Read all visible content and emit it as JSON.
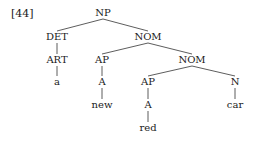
{
  "example_number": "[44]",
  "tree": {
    "nodes": [
      {
        "id": "np",
        "label": "NP",
        "x": 103,
        "y": 13
      },
      {
        "id": "det",
        "label": "DET",
        "x": 57,
        "y": 37
      },
      {
        "id": "nom1",
        "label": "NOM",
        "x": 148,
        "y": 37
      },
      {
        "id": "art",
        "label": "ART",
        "x": 57,
        "y": 60
      },
      {
        "id": "a_word",
        "label": "a",
        "x": 57,
        "y": 82
      },
      {
        "id": "ap1",
        "label": "AP",
        "x": 102,
        "y": 60
      },
      {
        "id": "nom2",
        "label": "NOM",
        "x": 192,
        "y": 60
      },
      {
        "id": "a1",
        "label": "A",
        "x": 102,
        "y": 82
      },
      {
        "id": "new",
        "label": "new",
        "x": 102,
        "y": 105
      },
      {
        "id": "ap2",
        "label": "AP",
        "x": 148,
        "y": 82
      },
      {
        "id": "n",
        "label": "N",
        "x": 235,
        "y": 82
      },
      {
        "id": "a2",
        "label": "A",
        "x": 148,
        "y": 105
      },
      {
        "id": "car",
        "label": "car",
        "x": 235,
        "y": 105
      },
      {
        "id": "red",
        "label": "red",
        "x": 148,
        "y": 128
      }
    ],
    "edges": [
      [
        "np",
        "det"
      ],
      [
        "np",
        "nom1"
      ],
      [
        "det",
        "art"
      ],
      [
        "art",
        "a_word"
      ],
      [
        "nom1",
        "ap1"
      ],
      [
        "nom1",
        "nom2"
      ],
      [
        "ap1",
        "a1"
      ],
      [
        "a1",
        "new"
      ],
      [
        "nom2",
        "ap2"
      ],
      [
        "nom2",
        "n"
      ],
      [
        "ap2",
        "a2"
      ],
      [
        "a2",
        "red"
      ],
      [
        "n",
        "car"
      ]
    ]
  }
}
